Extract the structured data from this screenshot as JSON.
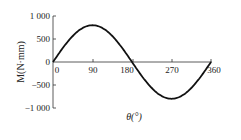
{
  "chart_data": {
    "type": "line",
    "title": "",
    "xlabel": "θ(°)",
    "ylabel": "M(N·mm)",
    "xlim": [
      0,
      360
    ],
    "ylim": [
      -1000,
      1000
    ],
    "x_ticks": [
      "0",
      "90",
      "180",
      "270",
      "360"
    ],
    "y_ticks": [
      "1 000",
      "500",
      "0",
      "−500",
      "−1 000"
    ],
    "grid": false,
    "legend": null,
    "series": [
      {
        "name": "M",
        "x": [
          0,
          30,
          60,
          90,
          120,
          150,
          180,
          210,
          240,
          270,
          300,
          330,
          360
        ],
        "values": [
          0,
          400,
          693,
          800,
          693,
          400,
          0,
          -400,
          -693,
          -800,
          -693,
          -400,
          0
        ]
      }
    ],
    "colors": {
      "line": "#111111",
      "axis": "#333333"
    }
  }
}
